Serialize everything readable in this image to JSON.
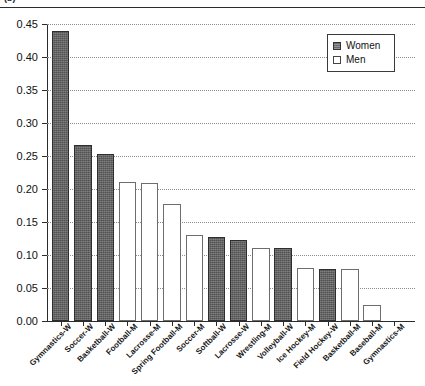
{
  "caption": {
    "text": "(b)"
  },
  "chart_data": {
    "type": "bar",
    "title": "",
    "subtitle": "",
    "xlabel": "",
    "ylabel": "",
    "ylim": [
      0.0,
      0.45
    ],
    "grid": true,
    "legend_position": "top-right",
    "ytick_labels": [
      "0.00",
      "0.05",
      "0.10",
      "0.15",
      "0.20",
      "0.25",
      "0.30",
      "0.35",
      "0.40",
      "0.45"
    ],
    "ytick_values": [
      0.0,
      0.05,
      0.1,
      0.15,
      0.2,
      0.25,
      0.3,
      0.35,
      0.4,
      0.45
    ],
    "categories": [
      "Gymnastics-W",
      "Soccer-W",
      "Basketball-W",
      "Football-M",
      "Lacrosse-M",
      "Spring Football-M",
      "Soccer-M",
      "Softball-W",
      "Lacrosse-W",
      "Wrestling-M",
      "Volleyball-W",
      "Ice Hockey-M",
      "Field Hockey-W",
      "Basketball-M",
      "Baseball-M",
      "Gymnastics-M"
    ],
    "values": [
      0.44,
      0.267,
      0.253,
      0.211,
      0.209,
      0.177,
      0.13,
      0.128,
      0.123,
      0.11,
      0.11,
      0.081,
      0.079,
      0.079,
      0.025,
      0.0
    ],
    "groups": [
      "Women",
      "Men",
      "Women",
      "Women",
      "Men",
      "Men",
      "Men",
      "Men",
      "Women",
      "Women",
      "Men",
      "Women",
      "Men",
      "Women",
      "Women",
      "Men",
      "Men"
    ],
    "series": [
      {
        "name": "Women",
        "color": "#636363",
        "points": [
          {
            "category": "Gymnastics-W",
            "value": 0.44
          },
          {
            "category": "Soccer-W",
            "value": 0.267
          },
          {
            "category": "Basketball-W",
            "value": 0.253
          },
          {
            "category": "Softball-W",
            "value": 0.128
          },
          {
            "category": "Lacrosse-W",
            "value": 0.123
          },
          {
            "category": "Volleyball-W",
            "value": 0.11
          },
          {
            "category": "Field Hockey-W",
            "value": 0.079
          }
        ]
      },
      {
        "name": "Men",
        "color": "#ffffff",
        "points": [
          {
            "category": "Football-M",
            "value": 0.211
          },
          {
            "category": "Lacrosse-M",
            "value": 0.209
          },
          {
            "category": "Spring Football-M",
            "value": 0.177
          },
          {
            "category": "Soccer-M",
            "value": 0.13
          },
          {
            "category": "Wrestling-M",
            "value": 0.11
          },
          {
            "category": "Ice Hockey-M",
            "value": 0.081
          },
          {
            "category": "Basketball-M",
            "value": 0.079
          },
          {
            "category": "Baseball-M",
            "value": 0.025
          },
          {
            "category": "Gymnastics-M",
            "value": 0.0
          }
        ]
      }
    ]
  },
  "legend": {
    "entries": [
      {
        "label": "Women",
        "kind": "women"
      },
      {
        "label": "Men",
        "kind": "men"
      }
    ]
  }
}
